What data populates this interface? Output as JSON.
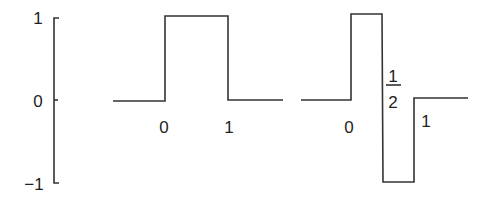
{
  "figure": {
    "line_color": "#333333"
  },
  "y_axis": {
    "ticks": [
      {
        "label": "1",
        "value": 1
      },
      {
        "label": "0",
        "value": 0
      },
      {
        "label": "−1",
        "value": -1
      }
    ]
  },
  "box_function": {
    "name": "scaling-function",
    "x_labels": [
      "0",
      "1"
    ],
    "segments": [
      {
        "x0": "-inf",
        "x1": 0,
        "y": 0
      },
      {
        "x0": 0,
        "x1": 1,
        "y": 1
      },
      {
        "x0": 1,
        "x1": "inf",
        "y": 0
      }
    ]
  },
  "haar_wavelet": {
    "name": "wavelet-function",
    "x_labels": [
      "0",
      "1"
    ],
    "half_label": {
      "numerator": "1",
      "denominator": "2"
    },
    "segments": [
      {
        "x0": "-inf",
        "x1": 0,
        "y": 0
      },
      {
        "x0": 0,
        "x1": 0.5,
        "y": 1
      },
      {
        "x0": 0.5,
        "x1": 1,
        "y": -1
      },
      {
        "x0": 1,
        "x1": "inf",
        "y": 0
      }
    ]
  }
}
